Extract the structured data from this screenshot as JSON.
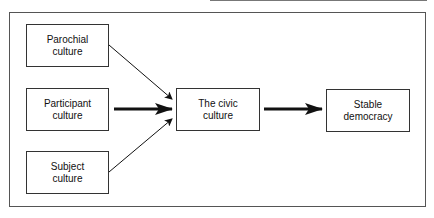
{
  "diagram": {
    "nodes": [
      {
        "id": "parochial",
        "label": "Parochial\nculture"
      },
      {
        "id": "participant",
        "label": "Participant\nculture"
      },
      {
        "id": "subject",
        "label": "Subject\nculture"
      },
      {
        "id": "civic",
        "label": "The civic\nculture"
      },
      {
        "id": "stable",
        "label": "Stable\ndemocracy"
      }
    ],
    "edges": [
      {
        "from": "parochial",
        "to": "civic",
        "weight": "thin"
      },
      {
        "from": "participant",
        "to": "civic",
        "weight": "thick"
      },
      {
        "from": "subject",
        "to": "civic",
        "weight": "thin"
      },
      {
        "from": "civic",
        "to": "stable",
        "weight": "thick"
      }
    ]
  }
}
